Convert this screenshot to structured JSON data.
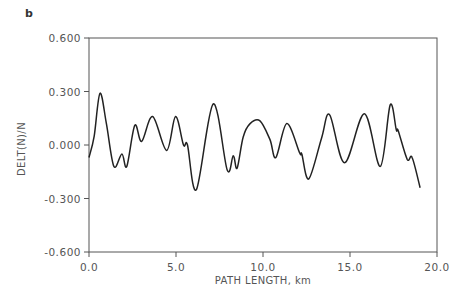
{
  "panel_label": "b",
  "chart_data": {
    "type": "line",
    "title": "",
    "xlabel": "PATH LENGTH, km",
    "ylabel": "DELT(N)/N",
    "xlim": [
      0.0,
      20.0
    ],
    "ylim": [
      -0.6,
      0.6
    ],
    "xticks": [
      0.0,
      5.0,
      10.0,
      15.0,
      20.0
    ],
    "xtick_labels": [
      "0.0",
      "5.0",
      "10.0",
      "15.0",
      "20.0"
    ],
    "yticks": [
      0.6,
      0.3,
      0.0,
      -0.3,
      -0.6
    ],
    "ytick_labels": [
      "0.600",
      "0.300",
      "0.000",
      "-0.300",
      "-0.600"
    ],
    "grid": false,
    "legend": null,
    "series": [
      {
        "name": "DELT(N)/N",
        "color": "#222222",
        "x": [
          0.0,
          0.3,
          0.63,
          1.0,
          1.43,
          1.89,
          2.17,
          2.63,
          3.03,
          3.66,
          4.46,
          4.97,
          5.43,
          5.66,
          6.17,
          7.14,
          7.94,
          8.29,
          8.51,
          8.86,
          9.26,
          9.83,
          10.4,
          10.74,
          11.37,
          12.11,
          12.23,
          12.63,
          13.37,
          13.83,
          14.69,
          15.83,
          16.74,
          17.31,
          17.66,
          17.77,
          18.29,
          18.57,
          19.03
        ],
        "y": [
          -0.07,
          0.05,
          0.29,
          0.12,
          -0.12,
          -0.05,
          -0.12,
          0.11,
          0.02,
          0.16,
          -0.03,
          0.16,
          0.0,
          0.0,
          -0.25,
          0.23,
          -0.14,
          -0.06,
          -0.13,
          0.045,
          0.12,
          0.135,
          0.03,
          -0.07,
          0.12,
          -0.045,
          -0.05,
          -0.19,
          0.04,
          0.17,
          -0.1,
          0.175,
          -0.12,
          0.225,
          0.085,
          0.08,
          -0.08,
          -0.07,
          -0.24
        ]
      }
    ]
  }
}
